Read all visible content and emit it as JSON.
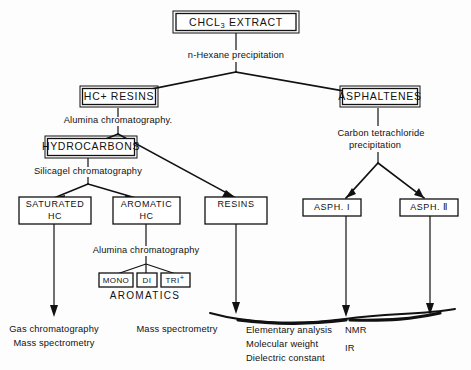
{
  "diagram": {
    "title_node": {
      "label": "CHCL",
      "sub": "3",
      "label_after": " EXTRACT"
    },
    "nodes": {
      "chcl3_extract": "CHCL3 EXTRACT",
      "hc_resins": "HC+ RESINS",
      "asphaltenes": "ASPHALTENES",
      "hydrocarbons": "HYDROCARBONS",
      "saturated_hc_line1": "SATURATED",
      "saturated_hc_line2": "HC",
      "aromatic_hc_line1": "AROMATIC",
      "aromatic_hc_line2": "HC",
      "resins": "RESINS",
      "asph_i": "ASPH. I",
      "asph_ii": "ASPH. Ⅱ",
      "mono": "MONO",
      "di": "DI",
      "tri": "TRI",
      "tri_sup": "+"
    },
    "process_labels": {
      "n_hexane": "n-Hexane precipitation",
      "alumina_1": "Alumina  chromatography.",
      "silicagel": "Silicagel  chromatography",
      "carbon_tet_line1": "Carbon    tetrachloride",
      "carbon_tet_line2": "precipitation",
      "alumina_2": "Alumina  chromatography"
    },
    "group_labels": {
      "aromatics": "AROMATICS"
    },
    "analyses": {
      "saturated_line1": "Gas chromatography",
      "saturated_line2": "Mass spectrometry",
      "aromatic_line1": "Mass spectrometry",
      "resins_line1": "Elementary analysis",
      "resins_line2": "Molecular weight",
      "resins_line3": "Dielectric constant",
      "asph_line1": "NMR",
      "asph_line2": "IR"
    },
    "colors": {
      "ink": "#111111",
      "paper": "#fdfdfd"
    }
  }
}
